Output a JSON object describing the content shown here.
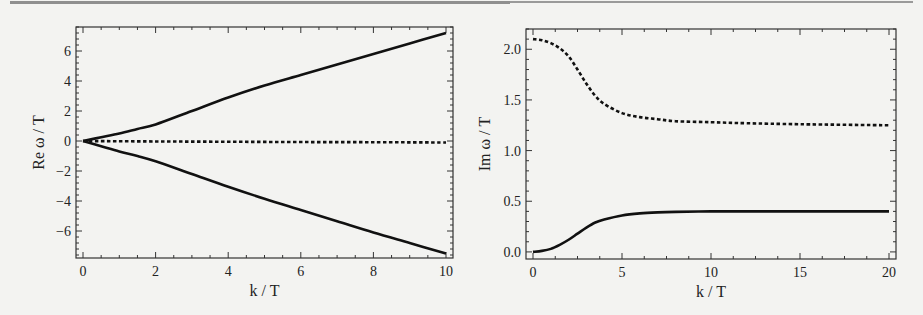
{
  "chart_data": [
    {
      "type": "line",
      "xlabel": "k / T",
      "ylabel": "Re ω / T",
      "xlim": [
        0,
        10
      ],
      "ylim": [
        -7.8,
        7.6
      ],
      "xticks": [
        0,
        2,
        4,
        6,
        8,
        10
      ],
      "xtick_labels": [
        "0",
        "2",
        "4",
        "6",
        "8",
        "10"
      ],
      "yticks": [
        -6,
        -4,
        -2,
        0,
        2,
        4,
        6
      ],
      "ytick_labels": [
        "−6",
        "−4",
        "−2",
        "0",
        "2",
        "4",
        "6"
      ],
      "grid": false,
      "series": [
        {
          "name": "upper",
          "style": "solid",
          "x": [
            0,
            0.5,
            1,
            1.5,
            2,
            3,
            4,
            5,
            6,
            7,
            8,
            9,
            10
          ],
          "y": [
            0,
            0.25,
            0.5,
            0.8,
            1.1,
            2.0,
            2.9,
            3.7,
            4.4,
            5.1,
            5.8,
            6.5,
            7.2
          ]
        },
        {
          "name": "lower",
          "style": "solid",
          "x": [
            0,
            0.5,
            1,
            1.5,
            2,
            3,
            4,
            5,
            6,
            7,
            8,
            9,
            10
          ],
          "y": [
            0,
            -0.35,
            -0.7,
            -1.0,
            -1.35,
            -2.2,
            -3.05,
            -3.85,
            -4.6,
            -5.35,
            -6.1,
            -6.8,
            -7.5
          ]
        },
        {
          "name": "middle",
          "style": "dashed",
          "x": [
            0,
            2,
            4,
            6,
            8,
            10
          ],
          "y": [
            0,
            -0.03,
            -0.05,
            -0.07,
            -0.08,
            -0.1
          ]
        }
      ]
    },
    {
      "type": "line",
      "xlabel": "k / T",
      "ylabel": "Im ω / T",
      "xlim": [
        0,
        20
      ],
      "ylim": [
        -0.07,
        2.2
      ],
      "xticks": [
        0,
        5,
        10,
        15,
        20
      ],
      "xtick_labels": [
        "0",
        "5",
        "10",
        "15",
        "20"
      ],
      "yticks": [
        0.0,
        0.5,
        1.0,
        1.5,
        2.0
      ],
      "ytick_labels": [
        "0.0",
        "0.5",
        "1.0",
        "1.5",
        "2.0"
      ],
      "grid": false,
      "series": [
        {
          "name": "upper",
          "style": "dashed",
          "x": [
            0,
            0.5,
            1,
            1.5,
            2,
            2.5,
            3,
            3.5,
            4,
            5,
            6,
            7,
            8,
            10,
            12,
            15,
            20
          ],
          "y": [
            2.1,
            2.09,
            2.06,
            2.01,
            1.93,
            1.8,
            1.66,
            1.54,
            1.46,
            1.37,
            1.33,
            1.31,
            1.29,
            1.28,
            1.27,
            1.26,
            1.25
          ]
        },
        {
          "name": "lower",
          "style": "solid",
          "x": [
            0,
            0.5,
            1,
            1.5,
            2,
            2.5,
            3,
            3.5,
            4,
            5,
            6,
            7,
            8,
            10,
            12,
            15,
            20
          ],
          "y": [
            0.0,
            0.01,
            0.03,
            0.07,
            0.12,
            0.18,
            0.24,
            0.29,
            0.32,
            0.36,
            0.38,
            0.39,
            0.395,
            0.4,
            0.4,
            0.4,
            0.4
          ]
        }
      ]
    }
  ]
}
